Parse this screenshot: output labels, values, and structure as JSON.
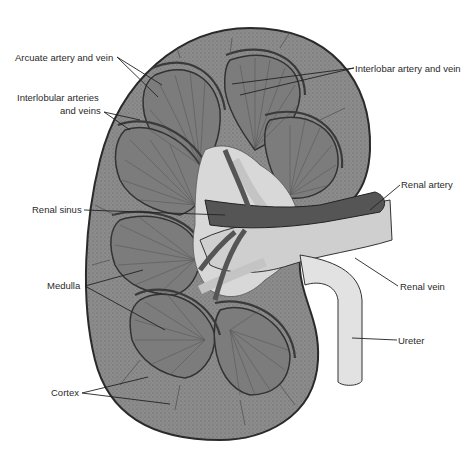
{
  "figure": {
    "colors": {
      "cortex": "#8a8a8a",
      "medulla": "#7a7a7a",
      "vessel": "#5a5a5a",
      "sinus": "#d8d8d8",
      "outline": "#2a2a2a",
      "ureter": "#e2e2e2"
    }
  },
  "labels": {
    "arcuate": "Arcuate artery and vein",
    "interlobular_1": "Interlobular arteries",
    "interlobular_2": "and veins",
    "renal_sinus": "Renal sinus",
    "medulla": "Medulla",
    "cortex": "Cortex",
    "interlobar": "Interlobar artery and vein",
    "renal_artery": "Renal artery",
    "renal_vein": "Renal vein",
    "ureter": "Ureter"
  }
}
